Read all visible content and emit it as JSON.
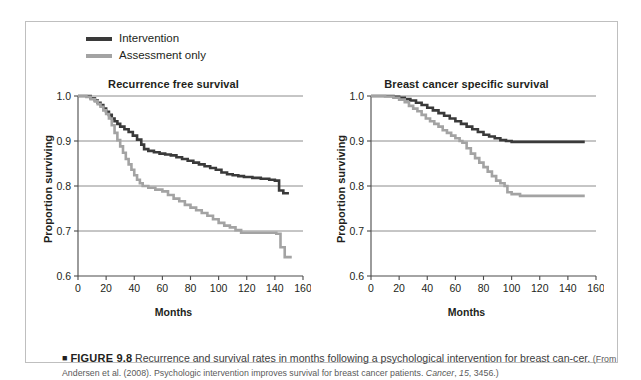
{
  "figure": {
    "marker": "■",
    "number": "FIGURE 9.8",
    "lead": "Recurrence and survival rates in months following a psychological intervention for breast can-cer.",
    "source_open": "(From Andersen et al. (2008). Psychologic intervention improves survival for breast cancer patients. ",
    "source_journal": "Cancer",
    "source_rest_a": ", ",
    "source_volume": "15",
    "source_rest_b": ", 3456.)"
  },
  "legend": {
    "position": "top-left",
    "items": [
      {
        "label": "Intervention",
        "color": "#3a3a3a"
      },
      {
        "label": "Assessment only",
        "color": "#a3a3a3"
      }
    ]
  },
  "colors": {
    "intervention": "#3a3a3a",
    "assessment": "#a3a3a3",
    "gridline": "#6f6f6f",
    "axis": "#4a4a4a",
    "frame": "#bfbfbf"
  },
  "chart_data": [
    {
      "type": "line",
      "panel": "left",
      "title": "Recurrence free survival",
      "xlabel": "Months",
      "ylabel": "Proportion surviving",
      "xlim": [
        0,
        160
      ],
      "ylim": [
        0.6,
        1.0
      ],
      "xticks": [
        0,
        20,
        40,
        60,
        80,
        100,
        120,
        140,
        160
      ],
      "yticks": [
        0.6,
        0.7,
        0.8,
        0.9,
        1.0
      ],
      "grid": "horizontal",
      "step": "post",
      "series": [
        {
          "name": "Intervention",
          "color": "#3a3a3a",
          "x": [
            0,
            6,
            9,
            12,
            14,
            16,
            18,
            20,
            22,
            24,
            26,
            28,
            30,
            33,
            36,
            39,
            42,
            45,
            47,
            50,
            54,
            58,
            62,
            66,
            70,
            74,
            78,
            82,
            86,
            90,
            94,
            98,
            102,
            106,
            110,
            114,
            118,
            124,
            130,
            136,
            140,
            143,
            146,
            150
          ],
          "y": [
            1.0,
            1.0,
            0.995,
            0.99,
            0.985,
            0.98,
            0.972,
            0.965,
            0.958,
            0.95,
            0.944,
            0.938,
            0.932,
            0.926,
            0.92,
            0.912,
            0.903,
            0.892,
            0.882,
            0.878,
            0.875,
            0.872,
            0.87,
            0.868,
            0.864,
            0.86,
            0.856,
            0.852,
            0.848,
            0.844,
            0.84,
            0.836,
            0.83,
            0.826,
            0.824,
            0.822,
            0.82,
            0.818,
            0.816,
            0.814,
            0.812,
            0.79,
            0.784,
            0.784
          ]
        },
        {
          "name": "Assessment only",
          "color": "#a3a3a3",
          "x": [
            0,
            6,
            9,
            12,
            14,
            16,
            18,
            20,
            22,
            24,
            26,
            28,
            30,
            32,
            34,
            36,
            38,
            40,
            42,
            44,
            46,
            50,
            55,
            60,
            64,
            68,
            72,
            76,
            80,
            84,
            88,
            92,
            96,
            100,
            104,
            108,
            112,
            116,
            120,
            128,
            136,
            141,
            144,
            147,
            152
          ],
          "y": [
            1.0,
            0.998,
            0.993,
            0.988,
            0.982,
            0.976,
            0.968,
            0.96,
            0.95,
            0.935,
            0.918,
            0.902,
            0.888,
            0.874,
            0.86,
            0.848,
            0.836,
            0.824,
            0.814,
            0.806,
            0.8,
            0.796,
            0.792,
            0.788,
            0.78,
            0.772,
            0.766,
            0.758,
            0.752,
            0.746,
            0.74,
            0.734,
            0.726,
            0.718,
            0.712,
            0.708,
            0.702,
            0.696,
            0.696,
            0.696,
            0.696,
            0.694,
            0.664,
            0.642,
            0.642
          ]
        }
      ]
    },
    {
      "type": "line",
      "panel": "right",
      "title": "Breast cancer specific survival",
      "xlabel": "Months",
      "ylabel": "Proportion surviving",
      "xlim": [
        0,
        160
      ],
      "ylim": [
        0.6,
        1.0
      ],
      "xticks": [
        0,
        20,
        40,
        60,
        80,
        100,
        120,
        140,
        160
      ],
      "yticks": [
        0.6,
        0.7,
        0.8,
        0.9,
        1.0
      ],
      "grid": "horizontal",
      "step": "post",
      "series": [
        {
          "name": "Intervention",
          "color": "#3a3a3a",
          "x": [
            0,
            10,
            16,
            20,
            24,
            28,
            32,
            36,
            40,
            44,
            48,
            52,
            56,
            60,
            64,
            68,
            72,
            76,
            80,
            84,
            88,
            92,
            96,
            100,
            106,
            112,
            120,
            130,
            140,
            152
          ],
          "y": [
            1.0,
            1.0,
            0.998,
            0.996,
            0.993,
            0.99,
            0.985,
            0.98,
            0.974,
            0.968,
            0.962,
            0.956,
            0.95,
            0.944,
            0.938,
            0.932,
            0.926,
            0.92,
            0.914,
            0.91,
            0.906,
            0.902,
            0.9,
            0.898,
            0.898,
            0.898,
            0.898,
            0.898,
            0.898,
            0.898
          ]
        },
        {
          "name": "Assessment only",
          "color": "#a3a3a3",
          "x": [
            0,
            10,
            16,
            20,
            24,
            27,
            30,
            33,
            36,
            39,
            42,
            45,
            48,
            51,
            54,
            57,
            60,
            63,
            65,
            68,
            71,
            74,
            77,
            80,
            83,
            86,
            89,
            92,
            95,
            97,
            100,
            106,
            114,
            126,
            140,
            152
          ],
          "y": [
            1.0,
            0.999,
            0.996,
            0.992,
            0.986,
            0.978,
            0.972,
            0.966,
            0.958,
            0.95,
            0.944,
            0.938,
            0.932,
            0.924,
            0.918,
            0.912,
            0.906,
            0.9,
            0.896,
            0.884,
            0.872,
            0.862,
            0.852,
            0.842,
            0.832,
            0.822,
            0.812,
            0.806,
            0.8,
            0.786,
            0.782,
            0.778,
            0.778,
            0.778,
            0.778,
            0.778
          ]
        }
      ]
    }
  ]
}
